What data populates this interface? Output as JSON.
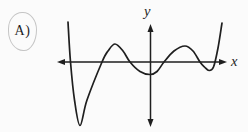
{
  "answer": {
    "label": "A)"
  },
  "colors": {
    "ink": "#1f1f1f",
    "circle_outline": "#c5c5c5",
    "background": "#fbfbfb"
  },
  "chart_data": {
    "type": "line",
    "title": "",
    "xlabel": "x",
    "ylabel": "y",
    "grid": false,
    "legend": false,
    "axis_arrows": "both-ends-of-both-axes",
    "xlim": [
      -93.5,
      76.5
    ],
    "ylim": [
      -65,
      38
    ],
    "x_intercepts_approx": [
      -80,
      -48.5,
      -20.5,
      13.5,
      49.5,
      64
    ],
    "local_minima": [
      [
        -70.5,
        -63.5
      ],
      [
        -0.5,
        -12.5
      ],
      [
        58.5,
        -8.5
      ]
    ],
    "local_maxima": [
      [
        -35.5,
        18
      ],
      [
        34.5,
        16
      ]
    ],
    "curve_points": [
      [
        -82.5,
        40
      ],
      [
        -80,
        0
      ],
      [
        -76,
        -38
      ],
      [
        -70.5,
        -63.5
      ],
      [
        -63.5,
        -38
      ],
      [
        -48.5,
        0
      ],
      [
        -42.5,
        11
      ],
      [
        -35.5,
        18
      ],
      [
        -27.5,
        11
      ],
      [
        -20.5,
        0
      ],
      [
        -10.5,
        -9.5
      ],
      [
        -0.5,
        -12.5
      ],
      [
        6.5,
        -9.5
      ],
      [
        13.5,
        0
      ],
      [
        23.5,
        11
      ],
      [
        34.5,
        16
      ],
      [
        42.5,
        11
      ],
      [
        49.5,
        0
      ],
      [
        54,
        -5
      ],
      [
        58.5,
        -8.5
      ],
      [
        63,
        -5
      ],
      [
        67.5,
        14
      ],
      [
        71.5,
        39
      ]
    ]
  }
}
